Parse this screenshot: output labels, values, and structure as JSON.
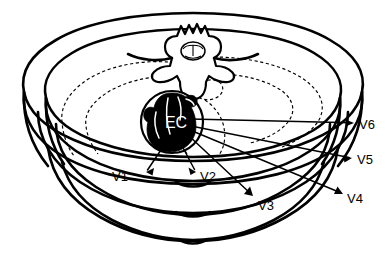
{
  "figure": {
    "background_color": "#ffffff",
    "line_color": "#000000"
  },
  "anatomy": {
    "heart_label": "EC",
    "heart_label_color": "#ffffff",
    "heart_fill_color": "#000000",
    "spine_name": "vertebra",
    "cord_name": "spinal-cord",
    "lung_boundary_style": "dashed"
  },
  "leads": [
    {
      "id": "V1",
      "label": "V1",
      "label_x": 128,
      "label_y": 178,
      "line_x1": 167,
      "line_y1": 141,
      "line_x2": 146,
      "line_y2": 172,
      "arrow_angle": 124,
      "arrow_x": 146,
      "arrow_y": 172
    },
    {
      "id": "V2",
      "label": "V2",
      "label_x": 200,
      "label_y": 178,
      "line_x1": 180,
      "line_y1": 142,
      "line_x2": 196,
      "line_y2": 172,
      "arrow_angle": 62,
      "arrow_x": 196,
      "arrow_y": 172
    },
    {
      "id": "V3",
      "label": "V3",
      "label_x": 258,
      "label_y": 207,
      "line_x1": 188,
      "line_y1": 135,
      "line_x2": 253,
      "line_y2": 196,
      "arrow_angle": 43,
      "arrow_x": 253,
      "arrow_y": 196
    },
    {
      "id": "V4",
      "label": "V4",
      "label_x": 347,
      "label_y": 200,
      "line_x1": 190,
      "line_y1": 130,
      "line_x2": 343,
      "line_y2": 194,
      "arrow_angle": 23,
      "arrow_x": 343,
      "arrow_y": 194
    },
    {
      "id": "V5",
      "label": "V5",
      "label_x": 357,
      "label_y": 161,
      "line_x1": 191,
      "line_y1": 126,
      "line_x2": 352,
      "line_y2": 158,
      "arrow_angle": 11,
      "arrow_x": 352,
      "arrow_y": 158
    },
    {
      "id": "V6",
      "label": "V6",
      "label_x": 359,
      "label_y": 126,
      "line_x1": 190,
      "line_y1": 119,
      "line_x2": 354,
      "line_y2": 123,
      "arrow_angle": 2,
      "arrow_x": 354,
      "arrow_y": 123
    }
  ]
}
